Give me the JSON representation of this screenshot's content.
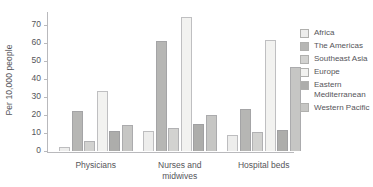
{
  "chart_data": {
    "type": "bar",
    "title": "",
    "subtitle": "",
    "xlabel": "",
    "ylabel": "Per 10,000 people",
    "categories": [
      "Physicians",
      "Nurses and\nmidwives",
      "Hospital beds"
    ],
    "series": [
      {
        "name": "Africa",
        "color": "#ededec",
        "values": [
          2,
          11,
          9
        ]
      },
      {
        "name": "The Americas",
        "color": "#b6b6b4",
        "values": [
          22,
          61,
          23.5
        ]
      },
      {
        "name": "Southeast Asia",
        "color": "#d2d2d0",
        "values": [
          5.5,
          13,
          10.5
        ]
      },
      {
        "name": "Europe",
        "color": "#f2f2f0",
        "values": [
          33,
          74.5,
          61.5
        ]
      },
      {
        "name": "Eastern\nMediterranean",
        "color": "#adadab",
        "values": [
          11,
          15,
          11.5
        ]
      },
      {
        "name": "Western Pacific",
        "color": "#c6c6c4",
        "values": [
          14.5,
          20,
          46.5
        ]
      }
    ],
    "ylim": [
      0,
      77
    ],
    "yticks": [
      0,
      10,
      20,
      30,
      40,
      50,
      60,
      70
    ],
    "ytick_labels": [
      "0",
      "10",
      "20",
      "30",
      "40",
      "50",
      "60",
      "70"
    ],
    "grid": false,
    "legend_position": "right"
  }
}
